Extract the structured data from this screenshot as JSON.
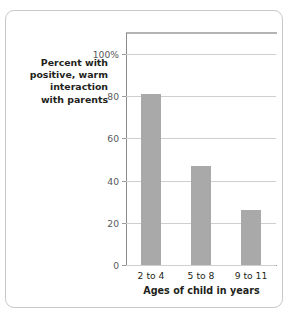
{
  "chart_data": {
    "type": "bar",
    "title": "",
    "categories": [
      "2 to 4",
      "5 to 8",
      "9 to 11"
    ],
    "values": [
      81,
      47,
      26
    ],
    "xlabel": "Ages of child in years",
    "ylabel": "Percent with positive, warm interaction with parents",
    "ylabel_lines": [
      "Percent with",
      "positive, warm",
      "interaction",
      "with parents"
    ],
    "ylim": [
      0,
      110
    ],
    "yticks": [
      0,
      20,
      40,
      60,
      80,
      100
    ],
    "ytick_labels": [
      "0",
      "20",
      "40",
      "60",
      "80",
      "100%"
    ],
    "grid": true,
    "legend": "none",
    "bar_color": "#a9a9a9",
    "grid_color": "#cfcfcf",
    "axis_color": "#9a9a9a",
    "text_color": "#231f20",
    "background": "#ffffff"
  }
}
